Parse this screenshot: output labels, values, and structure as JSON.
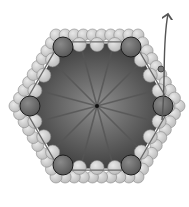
{
  "diagram": {
    "width": 189,
    "height": 207,
    "center": [
      97,
      106
    ],
    "colors": {
      "background": "#ffffff",
      "interior_center": "#8e8e8e",
      "interior_edge": "#3a3a3a",
      "spoke": "#555555",
      "outer_sphere": "#bdbdbd",
      "outer_sphere_edge": "#8a8a8a",
      "vertex_sphere": "#5a5a5a",
      "vertex_sphere_edge": "#1e1e1e",
      "outline": "#6a6a6a",
      "arrow": "#555555"
    },
    "hexagon_radius": 70,
    "spoke_count": 12,
    "vertex_spheres": [
      [
        63,
        47
      ],
      [
        131,
        47
      ],
      [
        163,
        106
      ],
      [
        131,
        165
      ],
      [
        63,
        165
      ],
      [
        30,
        106
      ]
    ],
    "arrow": {
      "from": [
        162,
        90
      ],
      "to": [
        168,
        14
      ],
      "label": ""
    }
  }
}
